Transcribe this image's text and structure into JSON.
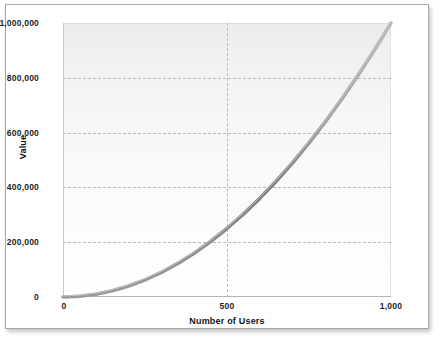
{
  "chart_data": {
    "type": "line",
    "title": "",
    "xlabel": "Number of Users",
    "ylabel": "Value",
    "xlim": [
      0,
      1000
    ],
    "ylim": [
      0,
      1000000
    ],
    "grid": true,
    "legend": false,
    "x_ticks": [
      {
        "value": 0,
        "label": "0"
      },
      {
        "value": 500,
        "label": "500"
      },
      {
        "value": 1000,
        "label": "1,000"
      }
    ],
    "y_ticks": [
      {
        "value": 0,
        "label": "0"
      },
      {
        "value": 200000,
        "label": "200,000"
      },
      {
        "value": 400000,
        "label": "400,000"
      },
      {
        "value": 600000,
        "label": "600,000"
      },
      {
        "value": 800000,
        "label": "800,000"
      },
      {
        "value": 1000000,
        "label": "1,000,000"
      }
    ],
    "series": [
      {
        "name": "Value",
        "color": "#8c8c8c",
        "x": [
          0,
          50,
          100,
          150,
          200,
          250,
          300,
          350,
          400,
          450,
          500,
          550,
          600,
          650,
          700,
          750,
          800,
          850,
          900,
          950,
          1000
        ],
        "values": [
          0,
          2500,
          10000,
          22500,
          40000,
          62500,
          90000,
          122500,
          160000,
          202500,
          250000,
          302500,
          360000,
          422500,
          490000,
          562500,
          640000,
          722500,
          810000,
          902500,
          1000000
        ]
      }
    ]
  },
  "style": {
    "curve_color": "#8c8c8c",
    "curve_highlight": "#c5c5c5",
    "grid_color": "#b9b9b9",
    "axis_color": "#b5b5b5",
    "plot_bg_top": "#ececec",
    "plot_bg_bottom": "#ffffff",
    "card_border": "#a8a8a8",
    "text_color": "#1d1d1d"
  }
}
